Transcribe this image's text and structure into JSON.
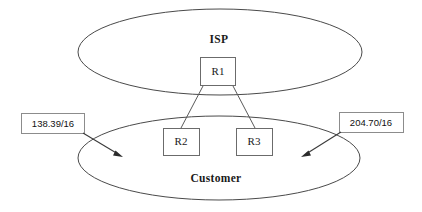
{
  "diagram": {
    "type": "network-topology",
    "stroke_color": "#4a4a4a",
    "background_color": "#ffffff",
    "text_color": "#1a1a1a"
  },
  "clouds": [
    {
      "id": "isp",
      "label": "ISP",
      "cx": 220,
      "cy": 52,
      "rx": 142,
      "ry": 43,
      "label_x": 219,
      "label_y": 40
    },
    {
      "id": "customer",
      "label": "Customer",
      "cx": 219,
      "cy": 158,
      "rx": 141,
      "ry": 42,
      "label_x": 216,
      "label_y": 179
    }
  ],
  "routers": [
    {
      "id": "r1",
      "label": "R1",
      "x": 200,
      "y": 57,
      "width": 36,
      "height": 29,
      "cloud": "isp"
    },
    {
      "id": "r2",
      "label": "R2",
      "x": 163,
      "y": 128,
      "width": 37,
      "height": 28,
      "cloud": "customer"
    },
    {
      "id": "r3",
      "label": "R3",
      "x": 236,
      "y": 128,
      "width": 37,
      "height": 28,
      "cloud": "customer"
    }
  ],
  "links": [
    {
      "id": "r1-r2",
      "from": "r1",
      "to": "r2",
      "x1": 203,
      "y1": 86,
      "x2": 181,
      "y2": 128
    },
    {
      "id": "r1-r3",
      "from": "r1",
      "to": "r3",
      "x1": 233,
      "y1": 86,
      "x2": 255,
      "y2": 128
    }
  ],
  "prefix_labels": [
    {
      "id": "left-prefix",
      "text": "138.39/16",
      "box_x": 21,
      "box_y": 113,
      "box_width": 64,
      "box_height": 21,
      "text_x": 53,
      "text_y": 124,
      "pointer": {
        "x1": 83,
        "y1": 133,
        "x2": 123,
        "y2": 157,
        "angle_deg": 31
      }
    },
    {
      "id": "right-prefix",
      "text": "204.70/16",
      "box_x": 339,
      "box_y": 112,
      "box_width": 65,
      "box_height": 21,
      "text_x": 371,
      "text_y": 123,
      "pointer": {
        "x1": 341,
        "y1": 132,
        "x2": 301,
        "y2": 157,
        "angle_deg": 148
      }
    }
  ]
}
